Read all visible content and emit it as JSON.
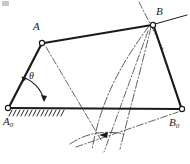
{
  "figure": {
    "kind": "four-bar-linkage-kinematic-diagram",
    "title": "",
    "background_color": "#ffffff",
    "line_color": "#1a1a1a",
    "construction_color": "#3a3a3a",
    "labels": {
      "point_A": "A",
      "point_B": "B",
      "ground_pivot_left_main": "A",
      "ground_pivot_left_sub": "0",
      "ground_pivot_right_main": "B",
      "ground_pivot_right_sub": "0",
      "angle": "θ"
    },
    "joints": [
      {
        "name": "A0",
        "label": "A",
        "subscript": "0",
        "x": 8,
        "y": 108,
        "type": "fixed-pivot"
      },
      {
        "name": "B0",
        "label": "B",
        "subscript": "0",
        "x": 182,
        "y": 109,
        "type": "fixed-pivot"
      },
      {
        "name": "A",
        "label": "A",
        "subscript": "",
        "x": 42,
        "y": 43,
        "type": "moving-pivot"
      },
      {
        "name": "B",
        "label": "B",
        "subscript": "",
        "x": 153,
        "y": 25,
        "type": "moving-pivot"
      }
    ],
    "links": [
      {
        "name": "crank-A0-A",
        "from": "A0",
        "to": "A"
      },
      {
        "name": "coupler-A-B",
        "from": "A",
        "to": "B"
      },
      {
        "name": "rocker-B-B0",
        "from": "B",
        "to": "B0"
      },
      {
        "name": "frame-A0-B0",
        "from": "A0",
        "to": "B0"
      }
    ],
    "angle_marker": {
      "name": "theta",
      "symbol": "θ",
      "vertex": "A0",
      "from_ray": "ground-line",
      "to_ray": "crank-A0-A",
      "double_arrow": true
    },
    "ground_hatching": {
      "name": "ground-hatching",
      "start_x": 10,
      "end_x": 64,
      "y": 110,
      "tick_count": 14
    }
  }
}
